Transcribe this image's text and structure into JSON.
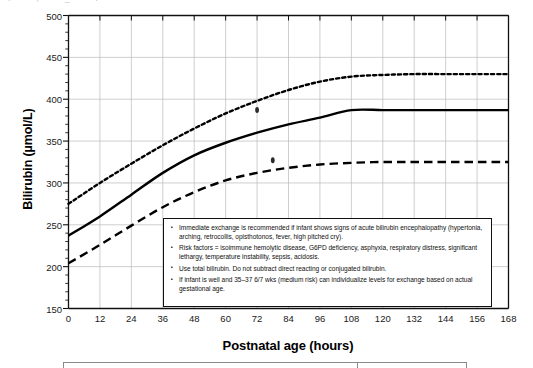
{
  "chart_data": {
    "type": "line",
    "title": "",
    "xlabel": "Postnatal age (hours)",
    "ylabel": "Bilirubin (µmol/L)",
    "xlim": [
      0,
      168
    ],
    "ylim": [
      150,
      500
    ],
    "xticks": [
      0,
      12,
      24,
      36,
      48,
      60,
      72,
      84,
      96,
      108,
      120,
      132,
      144,
      156,
      168
    ],
    "yticks": [
      150,
      200,
      250,
      300,
      350,
      400,
      450,
      500
    ],
    "y_minor_tick_step": 10,
    "grid": true,
    "grid_color": "#b9b9b9",
    "legend_position": "none",
    "series": [
      {
        "name": "Infants at lower risk (≥38 wks and well)",
        "style": "dotted",
        "color": "#000000",
        "x": [
          0,
          12,
          24,
          36,
          48,
          60,
          72,
          84,
          96,
          108,
          120,
          132,
          144,
          156,
          168
        ],
        "values": [
          275,
          300,
          323,
          345,
          365,
          383,
          398,
          411,
          421,
          427,
          429,
          430,
          430,
          430,
          430
        ]
      },
      {
        "name": "Infants at medium risk (≥38 wks + risk factors or 35–37 6/7 wks and well)",
        "style": "solid",
        "color": "#000000",
        "x": [
          0,
          12,
          24,
          36,
          48,
          60,
          72,
          84,
          96,
          108,
          120,
          132,
          144,
          156,
          168
        ],
        "values": [
          237,
          260,
          286,
          312,
          333,
          348,
          360,
          370,
          378,
          387,
          387,
          387,
          387,
          387,
          387
        ]
      },
      {
        "name": "Infants at higher risk (35–37 6/7 wks + risk factors)",
        "style": "dashed",
        "color": "#000000",
        "x": [
          0,
          12,
          24,
          36,
          48,
          60,
          72,
          84,
          96,
          108,
          120,
          132,
          144,
          156,
          168
        ],
        "values": [
          204,
          226,
          249,
          271,
          289,
          303,
          312,
          318,
          322,
          324,
          325,
          325,
          325,
          325,
          325
        ]
      }
    ],
    "markers": [
      {
        "x": 72,
        "y": 387,
        "label": "0"
      },
      {
        "x": 78,
        "y": 327,
        "label": "0"
      }
    ]
  },
  "annotation": {
    "bullets": [
      "Immediate exchange is recommended if infant shows signs of acute bilirubin encephalopathy (hypertonia, arching, retrocollis, opisthotonos, fever, high pitched cry).",
      "Risk factors = isoimmune hemolytic disease, G6PD deficiency, asphyxia, respiratory distress, significant lethargy, temperature instability, sepsis, acidosis.",
      "Use total bilirubin. Do not subtract direct reacting or conjugated bilirubin.",
      "If infant is well and 35–37 6/7 wks (medium risk) can individualize levels for exchange based on actual gestational age."
    ]
  }
}
